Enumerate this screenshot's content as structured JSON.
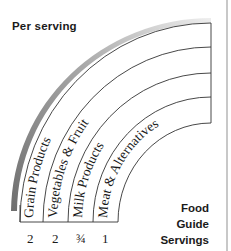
{
  "diagram": {
    "title": "Per serving",
    "legend_lines": [
      "Food",
      "Guide",
      "Servings"
    ],
    "groups": [
      {
        "label": "Grain Products",
        "servings": "2"
      },
      {
        "label": "Vegetables & Fruit",
        "servings": "2"
      },
      {
        "label": "Milk Products",
        "servings": "¾"
      },
      {
        "label": "Meat & Alternatives",
        "servings": "1"
      }
    ],
    "colors": {
      "lines": "#333333",
      "outer_band_dark": "#7a7a7a",
      "outer_band_light": "#e6e6e6",
      "text": "#1a1a1a"
    }
  }
}
